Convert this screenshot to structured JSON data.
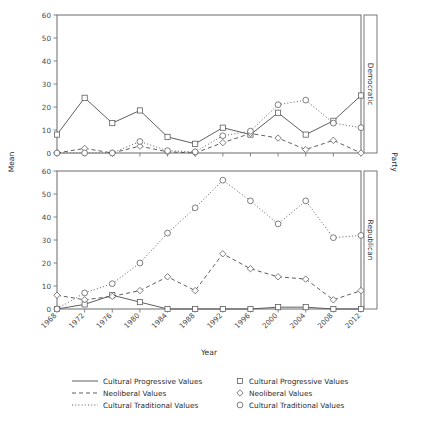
{
  "figure": {
    "axis_titles": {
      "y": "Mean",
      "x": "Year"
    },
    "outer_strip_label": "Party",
    "panels": [
      {
        "strip_label": "Democratic"
      },
      {
        "strip_label": "Republican"
      }
    ],
    "y_ticks": [
      "0",
      "10",
      "20",
      "30",
      "40",
      "50",
      "60"
    ],
    "x_ticks": [
      "1968",
      "1972",
      "1976",
      "1980",
      "1984",
      "1988",
      "1992",
      "1996",
      "2000",
      "2004",
      "2008",
      "2012"
    ]
  },
  "legend": {
    "line_entries": [
      {
        "label": "Cultural Progressive Values",
        "style": "solid"
      },
      {
        "label": "Neoliberal Values",
        "style": "dashed"
      },
      {
        "label": "Cultural Traditional Values",
        "style": "dotted"
      }
    ],
    "symbol_entries": [
      {
        "label": "Cultural Progressive Values",
        "symbol": "square"
      },
      {
        "label": "Neoliberal Values",
        "symbol": "diamond"
      },
      {
        "label": "Cultural Traditional Values",
        "symbol": "circle"
      }
    ]
  },
  "chart_data": {
    "type": "line",
    "title": "",
    "xlabel": "Year",
    "ylabel": "Mean",
    "xlim": [
      1968,
      2012
    ],
    "ylim": [
      0,
      60
    ],
    "grid": false,
    "legend_position": "bottom",
    "facet_variable": "Party",
    "x": [
      1968,
      1972,
      1976,
      1980,
      1984,
      1988,
      1992,
      1996,
      2000,
      2004,
      2008,
      2012
    ],
    "panels": [
      {
        "facet": "Democratic",
        "series": [
          {
            "name": "Cultural Progressive Values",
            "style": "solid",
            "symbol": "square",
            "values": [
              8,
              24,
              13,
              18.5,
              7,
              4,
              11,
              8,
              17.5,
              8,
              14,
              25
            ]
          },
          {
            "name": "Neoliberal Values",
            "style": "dashed",
            "symbol": "diamond",
            "values": [
              0,
              2,
              0,
              3,
              0.5,
              0,
              4.5,
              8.5,
              6.5,
              1.5,
              5.5,
              0
            ]
          },
          {
            "name": "Cultural Traditional Values",
            "style": "dotted",
            "symbol": "circle",
            "values": [
              0,
              0,
              0,
              5,
              1,
              0.5,
              7.5,
              9.5,
              21,
              23,
              13,
              11
            ]
          }
        ]
      },
      {
        "facet": "Republican",
        "series": [
          {
            "name": "Cultural Progressive Values",
            "style": "solid",
            "symbol": "square",
            "values": [
              0,
              2,
              6,
              3,
              0,
              0,
              0,
              0,
              0.8,
              0.8,
              0,
              0
            ]
          },
          {
            "name": "Neoliberal Values",
            "style": "dashed",
            "symbol": "diamond",
            "values": [
              6,
              4,
              5.5,
              8,
              14,
              8,
              24,
              17.5,
              14,
              13,
              4,
              8
            ]
          },
          {
            "name": "Cultural Traditional Values",
            "style": "dotted",
            "symbol": "circle",
            "values": [
              0,
              7,
              11,
              20,
              33,
              44,
              56,
              47,
              37,
              47,
              31,
              32
            ]
          }
        ]
      }
    ]
  }
}
